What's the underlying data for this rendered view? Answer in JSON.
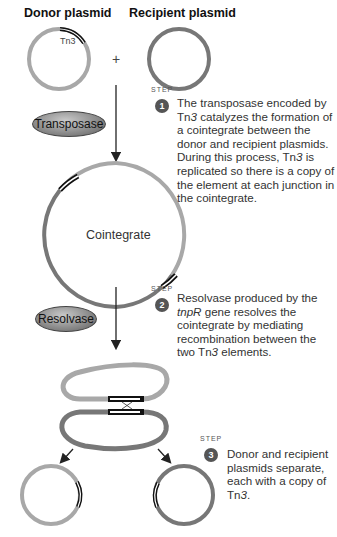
{
  "titles": {
    "donor": "Donor plasmid",
    "recipient": "Recipient plasmid"
  },
  "labels": {
    "tn3": "Tn3",
    "plus": "+",
    "cointegrate": "Cointegrate"
  },
  "enzymes": {
    "transposase": "Transposase",
    "resolvase": "Resolvase"
  },
  "steps": [
    {
      "word": "STEP",
      "number": "1",
      "text_html": "The transposase encoded by Tn<i>3</i> catalyzes the formation of a cointegrate between the donor and recipient plasmids. During this process, Tn<i>3</i> is replicated so there is a copy of the element at each junction in the cointegrate.",
      "text": "The transposase encoded by Tn3 catalyzes the formation of a cointegrate between the donor and recipient plasmids. During this process, Tn3 is replicated so there is a copy of the element at each junction in the cointegrate."
    },
    {
      "word": "STEP",
      "number": "2",
      "text_html": "Resolvase produced by the <i>tnpR</i> gene resolves the cointegrate by mediating recombination between the two Tn<i>3</i> elements.",
      "text": "Resolvase produced by the tnpR gene resolves the cointegrate by mediating recombination between the two Tn3 elements."
    },
    {
      "word": "STEP",
      "number": "3",
      "text_html": "Donor and recipient plasmids separate, each with a copy of Tn<i>3</i>.",
      "text": "Donor and recipient plasmids separate, each with a copy of Tn3."
    }
  ],
  "colors": {
    "donor": "#a8a8a8",
    "recipient": "#777777",
    "element": "#111111",
    "arrow": "#222222"
  }
}
